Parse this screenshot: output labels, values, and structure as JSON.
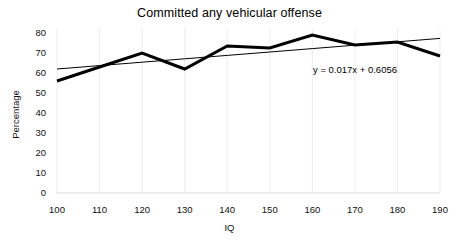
{
  "chart_data": {
    "type": "line",
    "title": "Committed any vehicular offense",
    "xlabel": "IQ",
    "ylabel": "Percentage",
    "x": [
      100,
      110,
      120,
      130,
      140,
      150,
      160,
      170,
      180,
      190
    ],
    "xtick_labels": [
      "100",
      "110",
      "120",
      "130",
      "140",
      "150",
      "160",
      "170",
      "180",
      "190"
    ],
    "ytick_labels": [
      "0",
      "10",
      "20",
      "30",
      "40",
      "50",
      "60",
      "70",
      "80"
    ],
    "yticks": [
      0,
      10,
      20,
      30,
      40,
      50,
      60,
      70,
      80
    ],
    "xlim": [
      100,
      190
    ],
    "ylim": [
      0,
      80
    ],
    "grid": "vertical-only",
    "legend": "none",
    "series": [
      {
        "name": "Committed any vehicular offense",
        "values": [
          56,
          63,
          70,
          62,
          73.5,
          72.5,
          79,
          74,
          75.5,
          68.5
        ],
        "color": "#000000",
        "line_width": 3
      },
      {
        "name": "Linear trendline",
        "values": [
          62,
          63.7,
          65.4,
          67.1,
          68.8,
          70.5,
          72.2,
          73.9,
          75.6,
          77.3
        ],
        "color": "#000000",
        "line_width": 1
      }
    ],
    "annotations": [
      {
        "name": "trendline-equation",
        "text": "y = 0.017x + 0.6056"
      }
    ]
  }
}
